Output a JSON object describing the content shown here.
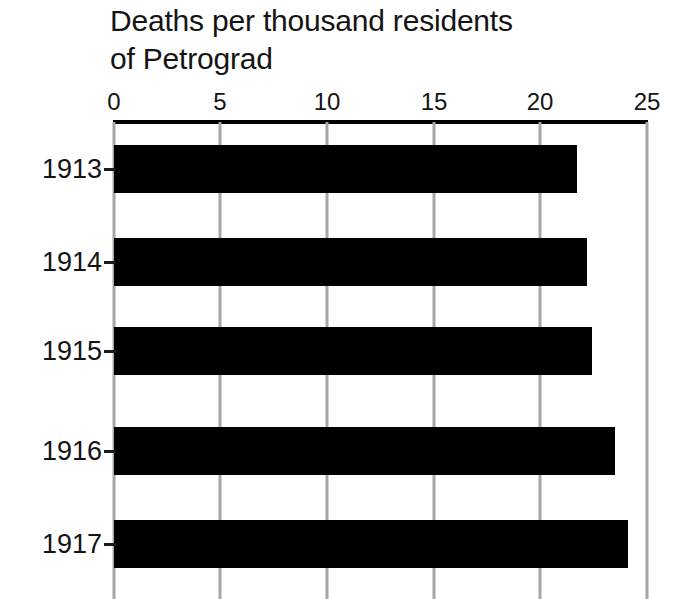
{
  "chart_data": {
    "type": "bar",
    "orientation": "horizontal",
    "title": "Deaths per thousand residents\nof Petrograd",
    "title_line1": "Deaths per thousand residents",
    "title_line2": "of Petrograd",
    "xlabel": "",
    "ylabel": "",
    "categories": [
      "1913",
      "1914",
      "1915",
      "1916",
      "1917"
    ],
    "values": [
      21.7,
      22.2,
      22.4,
      23.5,
      24.1
    ],
    "xlim": [
      0,
      25
    ],
    "xticks": [
      0,
      5,
      10,
      15,
      20,
      25
    ],
    "xtick_labels": [
      "0",
      "5",
      "10",
      "15",
      "20",
      "25"
    ],
    "grid": true,
    "grid_axis": "x",
    "legend": false,
    "bar_color": "#000000",
    "grid_color": "#a6a6a6",
    "axis_color": "#000000",
    "text_color": "#141414",
    "background": "#ffffff",
    "axis_position": "top"
  }
}
